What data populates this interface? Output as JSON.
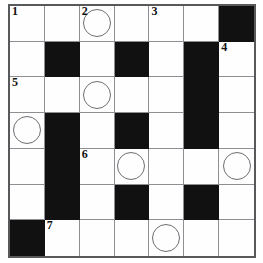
{
  "puzzle": {
    "type": "crossword-grid",
    "columns": 7,
    "rows": 7,
    "block_color": "#111111",
    "cell_color": "#fefefe",
    "grid_line_color": "#8d8f92",
    "border_color": "#58595b",
    "circle_color": "#6d6e71",
    "numbers_visible": [
      "1",
      "2",
      "3",
      "4",
      "5",
      "6",
      "7"
    ],
    "cells": [
      [
        {
          "block": false,
          "number": "1",
          "circle": false,
          "letter": ""
        },
        {
          "block": false,
          "number": "",
          "circle": false,
          "letter": ""
        },
        {
          "block": false,
          "number": "2",
          "circle": true,
          "letter": ""
        },
        {
          "block": false,
          "number": "",
          "circle": false,
          "letter": ""
        },
        {
          "block": false,
          "number": "3",
          "circle": false,
          "letter": ""
        },
        {
          "block": false,
          "number": "",
          "circle": false,
          "letter": ""
        },
        {
          "block": true,
          "number": "",
          "circle": false,
          "letter": ""
        }
      ],
      [
        {
          "block": false,
          "number": "",
          "circle": false,
          "letter": ""
        },
        {
          "block": true,
          "number": "",
          "circle": false,
          "letter": ""
        },
        {
          "block": false,
          "number": "",
          "circle": false,
          "letter": ""
        },
        {
          "block": true,
          "number": "",
          "circle": false,
          "letter": ""
        },
        {
          "block": false,
          "number": "",
          "circle": false,
          "letter": ""
        },
        {
          "block": true,
          "number": "",
          "circle": false,
          "letter": ""
        },
        {
          "block": false,
          "number": "4",
          "circle": false,
          "letter": ""
        }
      ],
      [
        {
          "block": false,
          "number": "5",
          "circle": false,
          "letter": ""
        },
        {
          "block": false,
          "number": "",
          "circle": false,
          "letter": ""
        },
        {
          "block": false,
          "number": "",
          "circle": true,
          "letter": ""
        },
        {
          "block": false,
          "number": "",
          "circle": false,
          "letter": ""
        },
        {
          "block": false,
          "number": "",
          "circle": false,
          "letter": ""
        },
        {
          "block": true,
          "number": "",
          "circle": false,
          "letter": ""
        },
        {
          "block": false,
          "number": "",
          "circle": false,
          "letter": ""
        }
      ],
      [
        {
          "block": false,
          "number": "",
          "circle": true,
          "letter": ""
        },
        {
          "block": true,
          "number": "",
          "circle": false,
          "letter": ""
        },
        {
          "block": false,
          "number": "",
          "circle": false,
          "letter": ""
        },
        {
          "block": true,
          "number": "",
          "circle": false,
          "letter": ""
        },
        {
          "block": false,
          "number": "",
          "circle": false,
          "letter": ""
        },
        {
          "block": true,
          "number": "",
          "circle": false,
          "letter": ""
        },
        {
          "block": false,
          "number": "",
          "circle": false,
          "letter": ""
        }
      ],
      [
        {
          "block": false,
          "number": "",
          "circle": false,
          "letter": ""
        },
        {
          "block": true,
          "number": "",
          "circle": false,
          "letter": ""
        },
        {
          "block": false,
          "number": "6",
          "circle": false,
          "letter": ""
        },
        {
          "block": false,
          "number": "",
          "circle": true,
          "letter": ""
        },
        {
          "block": false,
          "number": "",
          "circle": false,
          "letter": ""
        },
        {
          "block": false,
          "number": "",
          "circle": false,
          "letter": ""
        },
        {
          "block": false,
          "number": "",
          "circle": true,
          "letter": ""
        }
      ],
      [
        {
          "block": false,
          "number": "",
          "circle": false,
          "letter": ""
        },
        {
          "block": true,
          "number": "",
          "circle": false,
          "letter": ""
        },
        {
          "block": false,
          "number": "",
          "circle": false,
          "letter": ""
        },
        {
          "block": true,
          "number": "",
          "circle": false,
          "letter": ""
        },
        {
          "block": false,
          "number": "",
          "circle": false,
          "letter": ""
        },
        {
          "block": true,
          "number": "",
          "circle": false,
          "letter": ""
        },
        {
          "block": false,
          "number": "",
          "circle": false,
          "letter": ""
        }
      ],
      [
        {
          "block": true,
          "number": "",
          "circle": false,
          "letter": ""
        },
        {
          "block": false,
          "number": "7",
          "circle": false,
          "letter": ""
        },
        {
          "block": false,
          "number": "",
          "circle": false,
          "letter": ""
        },
        {
          "block": false,
          "number": "",
          "circle": false,
          "letter": ""
        },
        {
          "block": false,
          "number": "",
          "circle": true,
          "letter": ""
        },
        {
          "block": false,
          "number": "",
          "circle": false,
          "letter": ""
        },
        {
          "block": false,
          "number": "",
          "circle": false,
          "letter": ""
        }
      ]
    ]
  }
}
